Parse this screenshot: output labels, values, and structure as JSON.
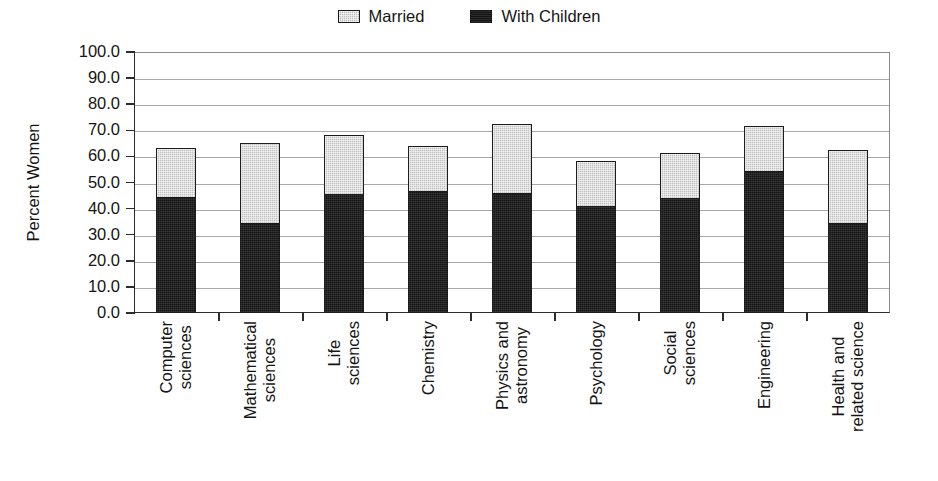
{
  "chart_data": {
    "type": "bar",
    "stacked": true,
    "title": "",
    "xlabel": "",
    "ylabel": "Percent Women",
    "ylim": [
      0,
      100
    ],
    "ytick_step": 10,
    "ytick_labels": [
      "100.0",
      "90.0",
      "80.0",
      "70.0",
      "60.0",
      "50.0",
      "40.0",
      "30.0",
      "20.0",
      "10.0",
      "0.0"
    ],
    "grid": true,
    "legend_position": "top-center",
    "categories": [
      "Computer sciences",
      "Mathematical sciences",
      "Life sciences",
      "Chemistry",
      "Physics and astronomy",
      "Psychology",
      "Social sciences",
      "Engineering",
      "Health and related science"
    ],
    "category_lines": [
      [
        "Computer",
        "sciences"
      ],
      [
        "Mathematical",
        "sciences"
      ],
      [
        "Life",
        "sciences"
      ],
      [
        "Chemistry",
        ""
      ],
      [
        "Physics and",
        "astronomy"
      ],
      [
        "Psychology",
        ""
      ],
      [
        "Social",
        "sciences"
      ],
      [
        "Engineering",
        ""
      ],
      [
        "Health and",
        "related science"
      ]
    ],
    "series": [
      {
        "name": "With Children",
        "color": "#141414",
        "values": [
          43.7,
          33.7,
          44.8,
          46.0,
          45.2,
          40.2,
          43.3,
          53.6,
          33.7
        ]
      },
      {
        "name": "Married",
        "color": "#c2c2c2",
        "note": "Married is the stack total (top of bar); gray portion = total minus With Children",
        "totals": [
          63.2,
          65.1,
          68.2,
          64.0,
          72.4,
          58.2,
          61.3,
          71.6,
          62.5
        ]
      }
    ]
  },
  "legend": {
    "entries": [
      {
        "label": "Married",
        "swatch": "light-gray-square"
      },
      {
        "label": "With Children",
        "swatch": "black-square"
      }
    ]
  },
  "colors": {
    "married": "#c2c2c2",
    "with_children": "#141414",
    "axis": "#2b2b2b",
    "grid": "#a8a8a8",
    "background": "#ffffff"
  }
}
